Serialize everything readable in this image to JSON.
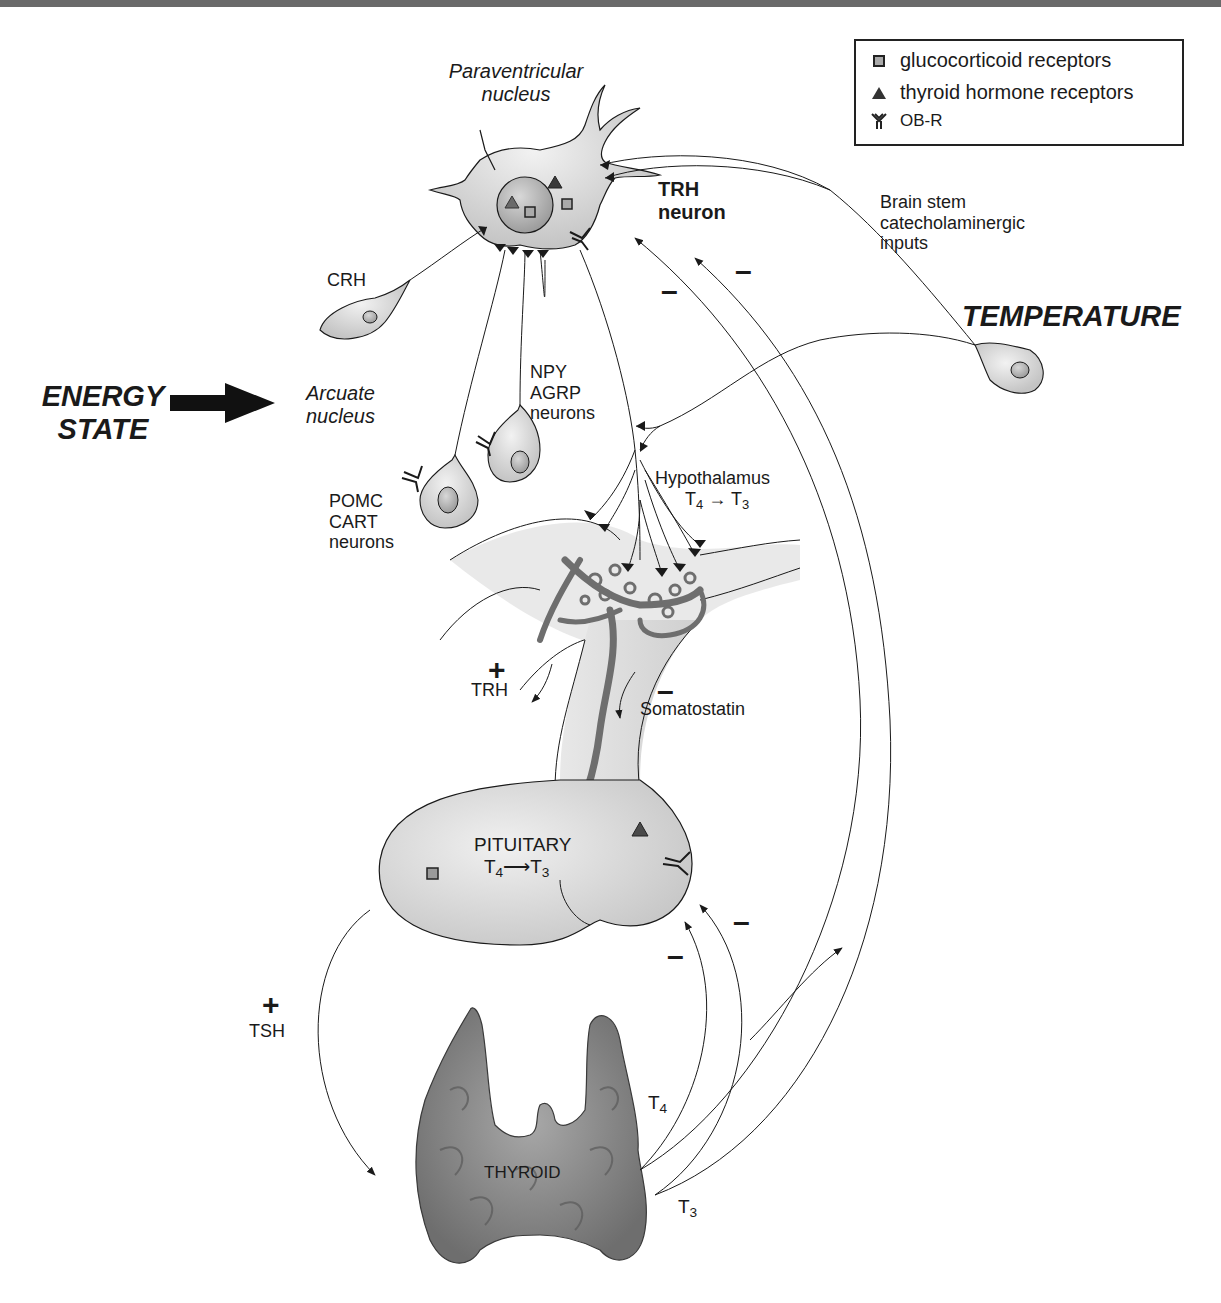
{
  "legend": {
    "items": [
      {
        "icon": "square-icon",
        "label": "glucocorticoid receptors"
      },
      {
        "icon": "triangle-icon",
        "label": "thyroid hormone receptors"
      },
      {
        "icon": "receptor-y-icon",
        "label": "OB-R"
      }
    ]
  },
  "labels": {
    "paraventricular": [
      "Paraventricular",
      "nucleus"
    ],
    "trh_neuron": [
      "TRH",
      "neuron"
    ],
    "brain_stem": [
      "Brain stem",
      "catecholaminergic",
      "inputs"
    ],
    "temperature": "TEMPERATURE",
    "crh": "CRH",
    "energy_state": [
      "ENERGY",
      "STATE"
    ],
    "arcuate": [
      "Arcuate",
      "nucleus"
    ],
    "npy": [
      "NPY",
      "AGRP",
      "neurons"
    ],
    "pomc": [
      "POMC",
      "CART",
      "neurons"
    ],
    "hypothalamus": "Hypothalamus",
    "hypothalamus_conv": {
      "from": "T",
      "from_sub": "4",
      "arrow": "→",
      "to": "T",
      "to_sub": "3"
    },
    "trh_plus": "+",
    "trh": "TRH",
    "somatostatin_minus": "–",
    "somatostatin": "Somatostatin",
    "pituitary": "PITUITARY",
    "pituitary_conv": {
      "from": "T",
      "from_sub": "4",
      "arrow": "⟶",
      "to": "T",
      "to_sub": "3"
    },
    "tsh_plus": "+",
    "tsh": "TSH",
    "thyroid": "THYROID",
    "t4": {
      "base": "T",
      "sub": "4"
    },
    "t3": {
      "base": "T",
      "sub": "3"
    },
    "minus": "–"
  },
  "colors": {
    "line": "#1a1a1a",
    "tissue": "#dcdcdc",
    "vessel": "#7a7a7a",
    "thyroid": "#9a9a9a",
    "topbar": "#6a6a6a"
  }
}
